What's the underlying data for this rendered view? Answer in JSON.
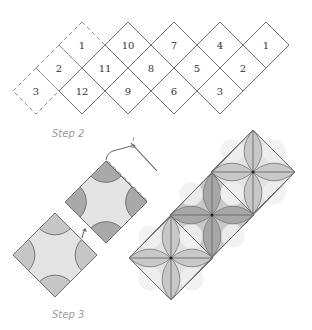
{
  "figure": {
    "step2": {
      "label": "Step 2",
      "grid": {
        "half_diagonal": 23,
        "cells": [
          {
            "number": "1",
            "cx": 82,
            "cy": 45,
            "dashed": true
          },
          {
            "number": "10",
            "cx": 128,
            "cy": 45,
            "dashed": false
          },
          {
            "number": "7",
            "cx": 174,
            "cy": 45,
            "dashed": false
          },
          {
            "number": "4",
            "cx": 220,
            "cy": 45,
            "dashed": false
          },
          {
            "number": "1",
            "cx": 266,
            "cy": 45,
            "dashed": false
          },
          {
            "number": "2",
            "cx": 59,
            "cy": 68,
            "dashed": true
          },
          {
            "number": "11",
            "cx": 105,
            "cy": 68,
            "dashed": false
          },
          {
            "number": "8",
            "cx": 151,
            "cy": 68,
            "dashed": false
          },
          {
            "number": "5",
            "cx": 197,
            "cy": 68,
            "dashed": false
          },
          {
            "number": "2",
            "cx": 243,
            "cy": 68,
            "dashed": false
          },
          {
            "number": "3",
            "cx": 36,
            "cy": 91,
            "dashed": true
          },
          {
            "number": "12",
            "cx": 82,
            "cy": 91,
            "dashed": false
          },
          {
            "number": "9",
            "cx": 128,
            "cy": 91,
            "dashed": false
          },
          {
            "number": "6",
            "cx": 174,
            "cy": 91,
            "dashed": false
          },
          {
            "number": "3",
            "cx": 220,
            "cy": 91,
            "dashed": false
          }
        ]
      }
    },
    "step3": {
      "label": "Step 3",
      "blocks": [
        {
          "name": "block-being-sewn",
          "cx": 106,
          "cy": 202,
          "h": 41,
          "corner_color": "#a9a9a9"
        },
        {
          "name": "block-to-attach",
          "cx": 55,
          "cy": 255,
          "h": 42,
          "corner_color": "#c6c6c6"
        }
      ],
      "quilt_strip": {
        "h": 42,
        "diamonds": [
          {
            "cx": 171,
            "cy": 258,
            "petal": "#c8c8c8",
            "ground": "#e2e2e2"
          },
          {
            "cx": 212,
            "cy": 215,
            "petal": "#a7a7a7",
            "ground": "#c9c9c9"
          },
          {
            "cx": 253,
            "cy": 172,
            "petal": "#c8c8c8",
            "ground": "#e2e2e2"
          }
        ]
      }
    },
    "colors": {
      "block_fill": "#e3e3e3",
      "outline": "#6a6a6a",
      "label": "#9a9a9a"
    }
  }
}
